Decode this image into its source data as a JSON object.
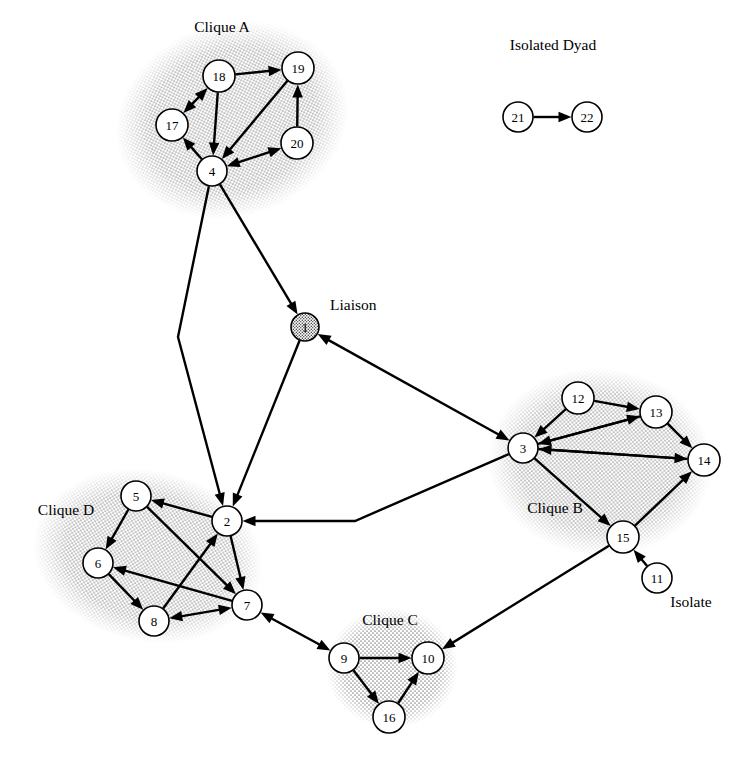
{
  "figure": {
    "title": "",
    "type": "directed-social-network-graph",
    "background": "#ffffff",
    "node_fill": "#ffffff",
    "node_stroke": "#000000",
    "shaded_fill": "#b9b9b9",
    "edge_color": "#000000"
  },
  "labels": [
    {
      "id": "clique-a",
      "text": "Clique A",
      "x": 222,
      "y": 32,
      "anchor": "middle"
    },
    {
      "id": "isolated-dyad",
      "text": "Isolated Dyad",
      "x": 553,
      "y": 50,
      "anchor": "middle"
    },
    {
      "id": "liaison",
      "text": "Liaison",
      "x": 330,
      "y": 310,
      "anchor": "start"
    },
    {
      "id": "clique-b",
      "text": "Clique B",
      "x": 555,
      "y": 513,
      "anchor": "middle"
    },
    {
      "id": "clique-d",
      "text": "Clique D",
      "x": 66,
      "y": 515,
      "anchor": "middle"
    },
    {
      "id": "clique-c",
      "text": "Clique C",
      "x": 390,
      "y": 625,
      "anchor": "middle"
    },
    {
      "id": "isolate",
      "text": "Isolate",
      "x": 691,
      "y": 607,
      "anchor": "middle"
    }
  ],
  "groups": [
    {
      "id": "clique-a",
      "name": "Clique A",
      "members": [
        17,
        18,
        19,
        20,
        4
      ],
      "cx": 232,
      "cy": 120,
      "rx": 118,
      "ry": 97,
      "rot": -18
    },
    {
      "id": "clique-b",
      "name": "Clique B",
      "members": [
        3,
        12,
        13,
        14,
        15
      ],
      "cx": 600,
      "cy": 462,
      "rx": 112,
      "ry": 94,
      "rot": 5
    },
    {
      "id": "clique-c",
      "name": "Clique C",
      "members": [
        9,
        10,
        16
      ],
      "cx": 392,
      "cy": 668,
      "rx": 66,
      "ry": 60,
      "rot": 0
    },
    {
      "id": "clique-d",
      "name": "Clique D",
      "members": [
        5,
        6,
        8,
        7,
        2
      ],
      "cx": 148,
      "cy": 556,
      "rx": 116,
      "ry": 86,
      "rot": 12
    }
  ],
  "nodes": [
    {
      "id": 1,
      "label": "1",
      "x": 305,
      "y": 327,
      "r": 14,
      "shaded": true,
      "role": "Liaison"
    },
    {
      "id": 2,
      "label": "2",
      "x": 227,
      "y": 521,
      "r": 15,
      "shaded": false,
      "role": "Clique D"
    },
    {
      "id": 3,
      "label": "3",
      "x": 523,
      "y": 448,
      "r": 15,
      "shaded": false,
      "role": "Clique B"
    },
    {
      "id": 4,
      "label": "4",
      "x": 212,
      "y": 171,
      "r": 15,
      "shaded": false,
      "role": "Clique A"
    },
    {
      "id": 5,
      "label": "5",
      "x": 136,
      "y": 496,
      "r": 15,
      "shaded": false,
      "role": "Clique D"
    },
    {
      "id": 6,
      "label": "6",
      "x": 98,
      "y": 563,
      "r": 15,
      "shaded": false,
      "role": "Clique D"
    },
    {
      "id": 7,
      "label": "7",
      "x": 247,
      "y": 605,
      "r": 15,
      "shaded": false,
      "role": "Clique D"
    },
    {
      "id": 8,
      "label": "8",
      "x": 154,
      "y": 621,
      "r": 15,
      "shaded": false,
      "role": "Clique D"
    },
    {
      "id": 9,
      "label": "9",
      "x": 344,
      "y": 658,
      "r": 15,
      "shaded": false,
      "role": "Clique C"
    },
    {
      "id": 10,
      "label": "10",
      "x": 428,
      "y": 658,
      "r": 16,
      "shaded": false,
      "role": "Clique C"
    },
    {
      "id": 11,
      "label": "11",
      "x": 657,
      "y": 578,
      "r": 15,
      "shaded": false,
      "role": "Isolate"
    },
    {
      "id": 12,
      "label": "12",
      "x": 578,
      "y": 398,
      "r": 16,
      "shaded": false,
      "role": "Clique B"
    },
    {
      "id": 13,
      "label": "13",
      "x": 656,
      "y": 412,
      "r": 16,
      "shaded": false,
      "role": "Clique B"
    },
    {
      "id": 14,
      "label": "14",
      "x": 704,
      "y": 460,
      "r": 16,
      "shaded": false,
      "role": "Clique B"
    },
    {
      "id": 15,
      "label": "15",
      "x": 623,
      "y": 537,
      "r": 16,
      "shaded": false,
      "role": "Clique B"
    },
    {
      "id": 16,
      "label": "16",
      "x": 389,
      "y": 717,
      "r": 16,
      "shaded": false,
      "role": "Clique C"
    },
    {
      "id": 17,
      "label": "17",
      "x": 172,
      "y": 125,
      "r": 16,
      "shaded": false,
      "role": "Clique A"
    },
    {
      "id": 18,
      "label": "18",
      "x": 219,
      "y": 76,
      "r": 16,
      "shaded": false,
      "role": "Clique A"
    },
    {
      "id": 19,
      "label": "19",
      "x": 298,
      "y": 68,
      "r": 16,
      "shaded": false,
      "role": "Clique A"
    },
    {
      "id": 20,
      "label": "20",
      "x": 297,
      "y": 143,
      "r": 16,
      "shaded": false,
      "role": "Clique A"
    },
    {
      "id": 21,
      "label": "21",
      "x": 518,
      "y": 117,
      "r": 15,
      "shaded": false,
      "role": "Isolated Dyad"
    },
    {
      "id": 22,
      "label": "22",
      "x": 587,
      "y": 117,
      "r": 15,
      "shaded": false,
      "role": "Isolated Dyad"
    }
  ],
  "edges": [
    {
      "from": 17,
      "to": 18,
      "bidirectional": true,
      "bend": []
    },
    {
      "from": 18,
      "to": 19,
      "bidirectional": false,
      "bend": []
    },
    {
      "from": 18,
      "to": 4,
      "bidirectional": false,
      "bend": []
    },
    {
      "from": 19,
      "to": 4,
      "bidirectional": false,
      "bend": []
    },
    {
      "from": 20,
      "to": 19,
      "bidirectional": false,
      "bend": []
    },
    {
      "from": 4,
      "to": 20,
      "bidirectional": true,
      "bend": []
    },
    {
      "from": 4,
      "to": 17,
      "bidirectional": false,
      "bend": []
    },
    {
      "from": 4,
      "to": 1,
      "bidirectional": false,
      "bend": []
    },
    {
      "from": 4,
      "to": 2,
      "bidirectional": false,
      "bend": [
        [
          178,
          337
        ]
      ]
    },
    {
      "from": 1,
      "to": 2,
      "bidirectional": false,
      "bend": []
    },
    {
      "from": 1,
      "to": 3,
      "bidirectional": true,
      "bend": []
    },
    {
      "from": 3,
      "to": 2,
      "bidirectional": false,
      "bend": [
        [
          355,
          521
        ]
      ]
    },
    {
      "from": 2,
      "to": 5,
      "bidirectional": false,
      "bend": []
    },
    {
      "from": 2,
      "to": 7,
      "bidirectional": false,
      "bend": []
    },
    {
      "from": 5,
      "to": 6,
      "bidirectional": false,
      "bend": []
    },
    {
      "from": 5,
      "to": 7,
      "bidirectional": false,
      "bend": []
    },
    {
      "from": 6,
      "to": 8,
      "bidirectional": false,
      "bend": []
    },
    {
      "from": 7,
      "to": 6,
      "bidirectional": false,
      "bend": []
    },
    {
      "from": 8,
      "to": 2,
      "bidirectional": false,
      "bend": []
    },
    {
      "from": 8,
      "to": 7,
      "bidirectional": true,
      "bend": []
    },
    {
      "from": 7,
      "to": 9,
      "bidirectional": true,
      "bend": []
    },
    {
      "from": 9,
      "to": 10,
      "bidirectional": false,
      "bend": []
    },
    {
      "from": 9,
      "to": 16,
      "bidirectional": false,
      "bend": []
    },
    {
      "from": 16,
      "to": 10,
      "bidirectional": false,
      "bend": []
    },
    {
      "from": 12,
      "to": 3,
      "bidirectional": false,
      "bend": []
    },
    {
      "from": 12,
      "to": 13,
      "bidirectional": false,
      "bend": []
    },
    {
      "from": 3,
      "to": 13,
      "bidirectional": false,
      "bend": []
    },
    {
      "from": 13,
      "to": 3,
      "bidirectional": false,
      "bend": []
    },
    {
      "from": 13,
      "to": 14,
      "bidirectional": false,
      "bend": []
    },
    {
      "from": 3,
      "to": 14,
      "bidirectional": false,
      "bend": []
    },
    {
      "from": 14,
      "to": 3,
      "bidirectional": false,
      "bend": []
    },
    {
      "from": 3,
      "to": 15,
      "bidirectional": false,
      "bend": []
    },
    {
      "from": 15,
      "to": 14,
      "bidirectional": false,
      "bend": []
    },
    {
      "from": 15,
      "to": 10,
      "bidirectional": false,
      "bend": []
    },
    {
      "from": 11,
      "to": 15,
      "bidirectional": false,
      "bend": []
    },
    {
      "from": 21,
      "to": 22,
      "bidirectional": false,
      "bend": []
    }
  ]
}
